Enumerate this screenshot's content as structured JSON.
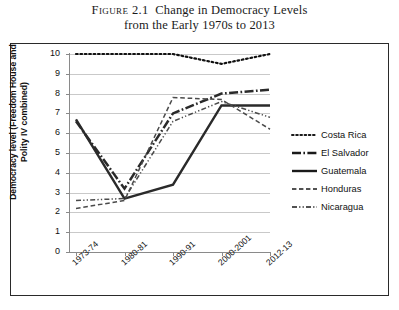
{
  "caption": {
    "figure_label": "Figure 2.1",
    "line1": "Change in Democracy Levels",
    "line2": "from the Early 1970s to 2013"
  },
  "axes": {
    "ylabel_line1": "Democracy level (Freedom House and",
    "ylabel_line2": "Polity IV combined)",
    "xlabel": "",
    "yticks": [
      "10",
      "9",
      "8",
      "7",
      "6",
      "5",
      "4",
      "3",
      "2",
      "1",
      "0"
    ],
    "xticks": [
      "1973-74",
      "1980-81",
      "1990-91",
      "2000-2001",
      "2012-13"
    ]
  },
  "legend": {
    "position": "right",
    "items": [
      {
        "label": "Costa Rica",
        "key": "dotted-line-key",
        "dash": "1.6,2.6",
        "width": 2.0
      },
      {
        "label": "El Salvador",
        "key": "dash-dot-thick-line-key",
        "dash": "9,2.4,1.6,2.4",
        "width": 2.4
      },
      {
        "label": "Guatemala",
        "key": "solid-line-key",
        "dash": "none",
        "width": 2.4
      },
      {
        "label": "Honduras",
        "key": "dashed-line-key",
        "dash": "4.4,2.6",
        "width": 1.5
      },
      {
        "label": "Nicaragua",
        "key": "dash-dot-dot-line-key",
        "dash": "5,2.2,1.2,2.2,1.2,2.2",
        "width": 1.5
      }
    ]
  },
  "chart_data": {
    "type": "line",
    "title": "Change in Democracy Levels from the Early 1970s to 2013",
    "xlabel": "",
    "ylabel": "Democracy level (Freedom House and Polity IV combined)",
    "categories": [
      "1973-74",
      "1980-81",
      "1990-91",
      "2000-2001",
      "2012-13"
    ],
    "ylim": [
      0,
      10
    ],
    "ytick_step": 1,
    "grid": "horizontal",
    "legend_position": "right",
    "series": [
      {
        "name": "Costa Rica",
        "values": [
          10.0,
          10.0,
          10.0,
          9.5,
          10.0
        ],
        "style": "dotted",
        "color": "#111111"
      },
      {
        "name": "El Salvador",
        "values": [
          6.6,
          3.2,
          7.0,
          8.0,
          8.2
        ],
        "style": "dash-dot",
        "color": "#2a2a2a"
      },
      {
        "name": "Guatemala",
        "values": [
          6.7,
          2.7,
          3.4,
          7.4,
          7.4
        ],
        "style": "solid",
        "color": "#2a2a2a"
      },
      {
        "name": "Honduras",
        "values": [
          2.2,
          2.6,
          7.8,
          7.7,
          6.2
        ],
        "style": "dashed",
        "color": "#4a4a4a"
      },
      {
        "name": "Nicaragua",
        "values": [
          2.6,
          2.7,
          6.6,
          7.6,
          6.8
        ],
        "style": "dash-dot-dot",
        "color": "#4a4a4a"
      }
    ]
  }
}
